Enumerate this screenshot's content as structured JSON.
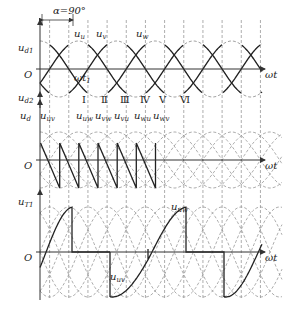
{
  "alpha_label": "α=90°",
  "origin_label": "O",
  "x_axis_label": "ωt",
  "time_marker": {
    "main": "ωt",
    "sub": "1"
  },
  "plots": [
    {
      "name": "ud1",
      "ylabel_main": "u",
      "ylabel_sub": "d1",
      "phases": [
        {
          "main": "u",
          "sub": "u"
        },
        {
          "main": "u",
          "sub": "v"
        },
        {
          "main": "u",
          "sub": "w"
        }
      ]
    },
    {
      "name": "ud2",
      "ylabel_main": "u",
      "ylabel_sub": "d2"
    },
    {
      "name": "ud",
      "ylabel_main": "u",
      "ylabel_sub": "d"
    },
    {
      "name": "uT1",
      "ylabel_main": "u",
      "ylabel_sub": "T1",
      "annotations": [
        {
          "main": "u",
          "sub": "uv"
        },
        {
          "main": "u",
          "sub": "uw"
        }
      ]
    }
  ],
  "intervals": [
    {
      "roman": "Ⅰ",
      "main": "u",
      "sub": "uw"
    },
    {
      "roman": "Ⅱ",
      "main": "u",
      "sub": "vw"
    },
    {
      "roman": "Ⅲ",
      "main": "u",
      "sub": "vu"
    },
    {
      "roman": "Ⅳ",
      "main": "u",
      "sub": "wu"
    },
    {
      "roman": "Ⅴ",
      "main": "u",
      "sub": "wv"
    },
    {
      "roman": "Ⅵ",
      "main": "",
      "sub": ""
    }
  ],
  "first_line_label": {
    "main": "u",
    "sub": "uv"
  },
  "colors": {
    "solid": "#222222",
    "dashed": "#8a8a8a",
    "axis": "#333333"
  }
}
